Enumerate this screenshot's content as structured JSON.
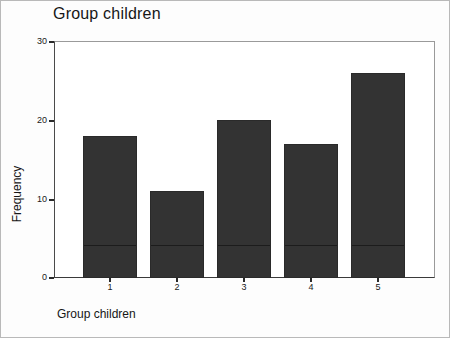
{
  "chart_data": {
    "type": "bar",
    "title": "Group children",
    "xlabel": "Group children",
    "ylabel": "Frequency",
    "categories": [
      "1",
      "2",
      "3",
      "4",
      "5"
    ],
    "values": [
      18,
      11,
      20,
      17,
      26
    ],
    "ylim": [
      0,
      30
    ],
    "yticks": [
      0,
      10,
      20,
      30
    ],
    "ytick_labels": [
      "0",
      "10",
      "20",
      "30"
    ],
    "xtick_labels": [
      "1",
      "2",
      "3",
      "4",
      "5"
    ],
    "grid": false,
    "legend": null,
    "bar_color": "#333333",
    "axis_color": "#2a2a2a",
    "background_color": "#ffffff"
  }
}
